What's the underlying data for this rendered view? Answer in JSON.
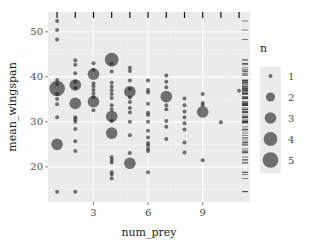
{
  "chart_data": {
    "type": "scatter",
    "title": "",
    "xlabel": "num_prey",
    "ylabel": "mean_wingspan",
    "xlim": [
      0.5,
      11.6
    ],
    "ylim": [
      12.2,
      54.4
    ],
    "x_ticks": [
      3,
      6,
      9
    ],
    "y_ticks": [
      20,
      30,
      40,
      50
    ],
    "grid": true,
    "size_legend": {
      "title": "n",
      "values": [
        1,
        2,
        3,
        4,
        5
      ],
      "position": "right"
    },
    "rugs": {
      "top": "x values",
      "right": "y values"
    },
    "point_color": "#1a1a1a",
    "point_alpha": 0.6,
    "panel_bg": "#ebebeb",
    "points": [
      {
        "x": 1,
        "y": 52.4,
        "n": 1
      },
      {
        "x": 1,
        "y": 50.4,
        "n": 1
      },
      {
        "x": 1,
        "y": 48.3,
        "n": 1
      },
      {
        "x": 1,
        "y": 39.3,
        "n": 1
      },
      {
        "x": 1,
        "y": 38.4,
        "n": 1
      },
      {
        "x": 1,
        "y": 37.4,
        "n": 5
      },
      {
        "x": 1,
        "y": 36.2,
        "n": 1
      },
      {
        "x": 1,
        "y": 35.1,
        "n": 1
      },
      {
        "x": 1,
        "y": 33.9,
        "n": 1
      },
      {
        "x": 1,
        "y": 31.0,
        "n": 1
      },
      {
        "x": 1,
        "y": 25.0,
        "n": 3
      },
      {
        "x": 1,
        "y": 14.5,
        "n": 1
      },
      {
        "x": 2,
        "y": 43.7,
        "n": 1
      },
      {
        "x": 2,
        "y": 42.7,
        "n": 1
      },
      {
        "x": 2,
        "y": 40.8,
        "n": 1
      },
      {
        "x": 2,
        "y": 38.9,
        "n": 1
      },
      {
        "x": 2,
        "y": 38.2,
        "n": 3
      },
      {
        "x": 2,
        "y": 37.5,
        "n": 1
      },
      {
        "x": 2,
        "y": 34.1,
        "n": 3
      },
      {
        "x": 2,
        "y": 31.0,
        "n": 1
      },
      {
        "x": 2,
        "y": 30.6,
        "n": 1
      },
      {
        "x": 2,
        "y": 30.0,
        "n": 1
      },
      {
        "x": 2,
        "y": 28.4,
        "n": 1
      },
      {
        "x": 2,
        "y": 25.7,
        "n": 1
      },
      {
        "x": 2,
        "y": 23.5,
        "n": 1
      },
      {
        "x": 2,
        "y": 14.5,
        "n": 1
      },
      {
        "x": 3,
        "y": 43.0,
        "n": 1
      },
      {
        "x": 3,
        "y": 41.6,
        "n": 1
      },
      {
        "x": 3,
        "y": 40.6,
        "n": 3
      },
      {
        "x": 3,
        "y": 38.6,
        "n": 1
      },
      {
        "x": 3,
        "y": 37.9,
        "n": 1
      },
      {
        "x": 3,
        "y": 37.1,
        "n": 1
      },
      {
        "x": 3,
        "y": 36.3,
        "n": 1
      },
      {
        "x": 3,
        "y": 35.5,
        "n": 1
      },
      {
        "x": 3,
        "y": 34.5,
        "n": 3
      },
      {
        "x": 3,
        "y": 32.6,
        "n": 1
      },
      {
        "x": 4,
        "y": 43.8,
        "n": 4
      },
      {
        "x": 4,
        "y": 42.9,
        "n": 1
      },
      {
        "x": 4,
        "y": 41.2,
        "n": 1
      },
      {
        "x": 4,
        "y": 38.7,
        "n": 1
      },
      {
        "x": 4,
        "y": 37.8,
        "n": 1
      },
      {
        "x": 4,
        "y": 37.0,
        "n": 1
      },
      {
        "x": 4,
        "y": 36.2,
        "n": 1
      },
      {
        "x": 4,
        "y": 35.3,
        "n": 1
      },
      {
        "x": 4,
        "y": 33.7,
        "n": 1
      },
      {
        "x": 4,
        "y": 32.8,
        "n": 1
      },
      {
        "x": 4,
        "y": 31.2,
        "n": 3
      },
      {
        "x": 4,
        "y": 30.2,
        "n": 1
      },
      {
        "x": 4,
        "y": 27.5,
        "n": 3
      },
      {
        "x": 4,
        "y": 22.2,
        "n": 1
      },
      {
        "x": 4,
        "y": 21.6,
        "n": 1
      },
      {
        "x": 4,
        "y": 21.0,
        "n": 1
      },
      {
        "x": 4,
        "y": 18.8,
        "n": 1
      },
      {
        "x": 4,
        "y": 18.3,
        "n": 1
      },
      {
        "x": 4,
        "y": 17.4,
        "n": 1
      },
      {
        "x": 5,
        "y": 42.0,
        "n": 1
      },
      {
        "x": 5,
        "y": 41.3,
        "n": 1
      },
      {
        "x": 5,
        "y": 39.2,
        "n": 1
      },
      {
        "x": 5,
        "y": 37.3,
        "n": 1
      },
      {
        "x": 5,
        "y": 36.7,
        "n": 3
      },
      {
        "x": 5,
        "y": 35.4,
        "n": 1
      },
      {
        "x": 5,
        "y": 34.4,
        "n": 1
      },
      {
        "x": 5,
        "y": 33.1,
        "n": 1
      },
      {
        "x": 5,
        "y": 32.1,
        "n": 1
      },
      {
        "x": 5,
        "y": 30.0,
        "n": 1
      },
      {
        "x": 5,
        "y": 27.0,
        "n": 1
      },
      {
        "x": 5,
        "y": 23.1,
        "n": 1
      },
      {
        "x": 5,
        "y": 20.8,
        "n": 3
      },
      {
        "x": 6,
        "y": 39.2,
        "n": 1
      },
      {
        "x": 6,
        "y": 37.1,
        "n": 1
      },
      {
        "x": 6,
        "y": 36.5,
        "n": 1
      },
      {
        "x": 6,
        "y": 34.0,
        "n": 1
      },
      {
        "x": 6,
        "y": 32.0,
        "n": 1
      },
      {
        "x": 6,
        "y": 31.5,
        "n": 1
      },
      {
        "x": 6,
        "y": 30.0,
        "n": 1
      },
      {
        "x": 6,
        "y": 28.0,
        "n": 1
      },
      {
        "x": 6,
        "y": 26.5,
        "n": 1
      },
      {
        "x": 6,
        "y": 25.3,
        "n": 1
      },
      {
        "x": 6,
        "y": 24.8,
        "n": 1
      },
      {
        "x": 6,
        "y": 24.0,
        "n": 1
      },
      {
        "x": 6,
        "y": 23.5,
        "n": 1
      },
      {
        "x": 6,
        "y": 18.8,
        "n": 1
      },
      {
        "x": 7,
        "y": 40.3,
        "n": 1
      },
      {
        "x": 7,
        "y": 38.9,
        "n": 1
      },
      {
        "x": 7,
        "y": 37.7,
        "n": 1
      },
      {
        "x": 7,
        "y": 35.6,
        "n": 3
      },
      {
        "x": 7,
        "y": 33.7,
        "n": 1
      },
      {
        "x": 7,
        "y": 32.8,
        "n": 1
      },
      {
        "x": 7,
        "y": 30.2,
        "n": 1
      },
      {
        "x": 7,
        "y": 28.9,
        "n": 1
      },
      {
        "x": 7,
        "y": 26.2,
        "n": 1
      },
      {
        "x": 8,
        "y": 35.2,
        "n": 1
      },
      {
        "x": 8,
        "y": 33.7,
        "n": 1
      },
      {
        "x": 8,
        "y": 32.3,
        "n": 1
      },
      {
        "x": 8,
        "y": 31.0,
        "n": 1
      },
      {
        "x": 8,
        "y": 29.7,
        "n": 1
      },
      {
        "x": 8,
        "y": 28.3,
        "n": 1
      },
      {
        "x": 8,
        "y": 25.4,
        "n": 1
      },
      {
        "x": 8,
        "y": 23.2,
        "n": 1
      },
      {
        "x": 9,
        "y": 36.2,
        "n": 1
      },
      {
        "x": 9,
        "y": 34.2,
        "n": 1
      },
      {
        "x": 9,
        "y": 33.7,
        "n": 1
      },
      {
        "x": 9,
        "y": 32.2,
        "n": 3
      },
      {
        "x": 9,
        "y": 21.5,
        "n": 1
      },
      {
        "x": 10,
        "y": 29.9,
        "n": 1
      },
      {
        "x": 11,
        "y": 36.9,
        "n": 1
      }
    ]
  }
}
